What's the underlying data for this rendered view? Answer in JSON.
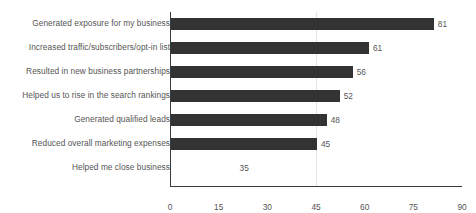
{
  "chart_data": {
    "type": "bar",
    "orientation": "horizontal",
    "title": "",
    "xlabel": "",
    "ylabel": "",
    "xlim": [
      0,
      90
    ],
    "xticks": [
      0,
      15,
      30,
      45,
      60,
      75,
      90
    ],
    "gridlines": [
      45
    ],
    "grid": true,
    "legend": false,
    "bar_color": "#333333",
    "text_color": "#555555",
    "axis_color": "#3a3a3a",
    "gridline_color": "#e2e2e2",
    "categories": [
      "Generated exposure for my business",
      "Increased traffic/subscribers/opt-in list",
      "Resulted in new business partnerships",
      "Helped us to rise in the search rankings",
      "Generated qualified leads",
      "Reduced overall marketing expenses",
      "Helped me close business"
    ],
    "values": [
      81,
      61,
      56,
      52,
      48,
      45,
      35
    ],
    "value_labels": [
      "81",
      "61",
      "56",
      "52",
      "48",
      "45",
      "35"
    ],
    "bars_rendered": [
      true,
      true,
      true,
      true,
      true,
      true,
      false
    ]
  }
}
